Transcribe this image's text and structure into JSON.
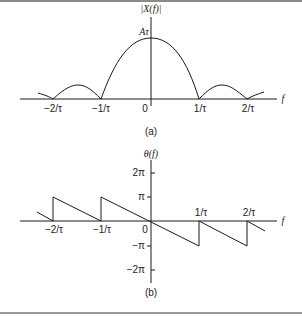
{
  "colors": {
    "ink": "#1a1a1a",
    "rule": "#8a8a8a",
    "background": "#ffffff"
  },
  "panel_a": {
    "y_label": "|X(f)|",
    "peak_label": "Aτ",
    "x_axis_label": "f",
    "ticks": [
      "−2/τ",
      "−1/τ",
      "0",
      "1/τ",
      "2/τ"
    ],
    "caption": "(a)"
  },
  "panel_b": {
    "y_label": "θ(f)",
    "x_axis_label": "f",
    "x_ticks_below": [
      "−2/τ",
      "−1/τ",
      "0"
    ],
    "x_ticks_above": [
      "1/τ",
      "2/τ"
    ],
    "y_ticks": [
      "2π",
      "π",
      "−π",
      "−2π"
    ],
    "caption": "(b)"
  }
}
